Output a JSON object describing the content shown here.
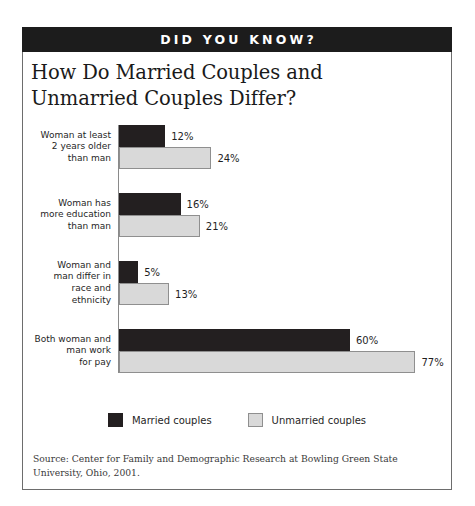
{
  "banner": {
    "label": "DID YOU KNOW?"
  },
  "title": "How Do Married Couples and Unmarried Couples Differ?",
  "legend": {
    "married": "Married couples",
    "unmarried": "Unmarried couples"
  },
  "source": "Source:  Center for Family and Demographic Research at Bowling Green State University, Ohio, 2001.",
  "colors": {
    "married": "#231f20",
    "unmarried": "#d9d9d9",
    "banner_background": "#1c1c1c",
    "banner_text": "#ffffff",
    "frame_border": "#6d6d6d"
  },
  "chart_data": {
    "type": "bar",
    "orientation": "horizontal",
    "title": "How Do Married Couples and Unmarried Couples Differ?",
    "xlabel": "",
    "ylabel": "",
    "xlim": [
      0,
      80
    ],
    "grid": false,
    "legend_position": "bottom-center",
    "value_suffix": "%",
    "categories": [
      "Woman at least\n2 years older\nthan man",
      "Woman has\nmore education\nthan man",
      "Woman and\nman differ in\nrace  and\nethnicity",
      "Both woman and\nman work\nfor pay"
    ],
    "series": [
      {
        "name": "Married couples",
        "color": "#231f20",
        "values": [
          12,
          16,
          5,
          60
        ]
      },
      {
        "name": "Unmarried couples",
        "color": "#d9d9d9",
        "values": [
          24,
          21,
          13,
          77
        ]
      }
    ],
    "groups": [
      {
        "label_lines": [
          "Woman at least",
          "2 years older",
          "than man"
        ],
        "married": {
          "value": 12,
          "label": "12%"
        },
        "unmarried": {
          "value": 24,
          "label": "24%"
        }
      },
      {
        "label_lines": [
          "Woman has",
          "more education",
          "than man"
        ],
        "married": {
          "value": 16,
          "label": "16%"
        },
        "unmarried": {
          "value": 21,
          "label": "21%"
        }
      },
      {
        "label_lines": [
          "Woman and",
          "man differ in",
          "race  and",
          "ethnicity"
        ],
        "married": {
          "value": 5,
          "label": "5%"
        },
        "unmarried": {
          "value": 13,
          "label": "13%"
        }
      },
      {
        "label_lines": [
          "Both woman and",
          "man work",
          "for pay"
        ],
        "married": {
          "value": 60,
          "label": "60%"
        },
        "unmarried": {
          "value": 77,
          "label": "77%"
        }
      }
    ],
    "source_note": "Source:  Center for Family and Demographic Research at Bowling Green State University, Ohio, 2001."
  }
}
